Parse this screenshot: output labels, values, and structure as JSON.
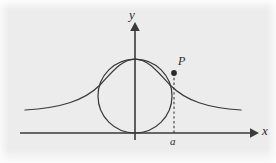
{
  "figure": {
    "type": "math-diagram",
    "background_color": "#ececed",
    "ink_color": "#3a3a3a",
    "labels": {
      "y_axis": "y",
      "x_axis": "x",
      "point": "P",
      "abscissa": "a"
    },
    "axes": {
      "origin": {
        "x": 135,
        "y": 133
      },
      "x_axis": {
        "x1": 20,
        "y1": 133,
        "x2": 256,
        "y2": 133,
        "arrow": "right"
      },
      "y_axis": {
        "x1": 135,
        "y1": 133,
        "x2": 135,
        "y2": 22,
        "arrow": "up"
      }
    },
    "circle": {
      "center_x": 135,
      "center_y": 96,
      "radius": 37,
      "tangent_to": "x-axis at origin"
    },
    "curve": {
      "shape": "bell",
      "peak_x": 135,
      "peak_y": 59,
      "left_end_x": 25,
      "right_end_x": 241,
      "tail_y": 110
    },
    "point_P": {
      "x": 174,
      "y": 73,
      "marker": "filled-dot"
    },
    "dashed_drop_line": {
      "x": 174,
      "y_top": 73,
      "y_bottom": 133,
      "style": "dashed"
    }
  }
}
